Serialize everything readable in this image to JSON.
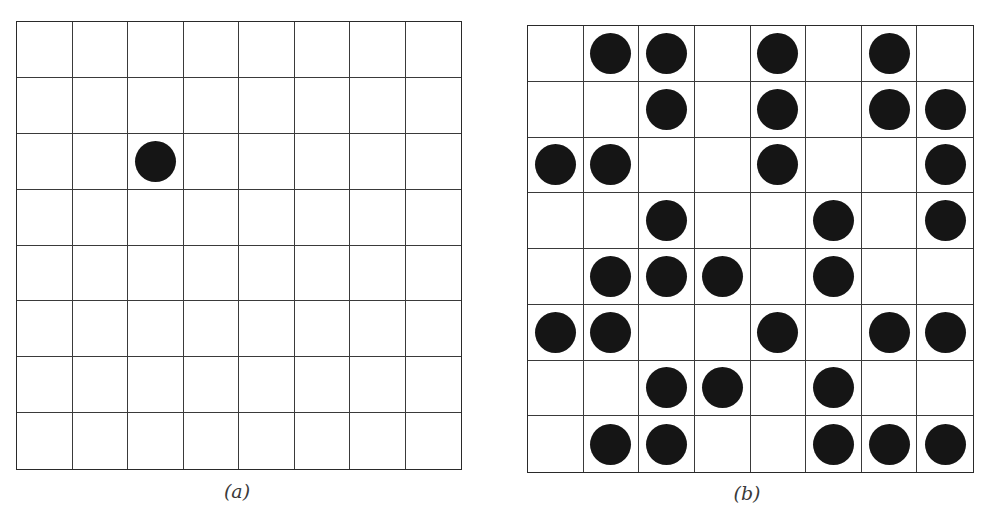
{
  "figure": {
    "rows": 8,
    "cols": 8,
    "panels": [
      {
        "id": "a",
        "caption": "(a)",
        "cells": [
          [
            0,
            0,
            0,
            0,
            0,
            0,
            0,
            0
          ],
          [
            0,
            0,
            0,
            0,
            0,
            0,
            0,
            0
          ],
          [
            0,
            0,
            1,
            0,
            0,
            0,
            0,
            0
          ],
          [
            0,
            0,
            0,
            0,
            0,
            0,
            0,
            0
          ],
          [
            0,
            0,
            0,
            0,
            0,
            0,
            0,
            0
          ],
          [
            0,
            0,
            0,
            0,
            0,
            0,
            0,
            0
          ],
          [
            0,
            0,
            0,
            0,
            0,
            0,
            0,
            0
          ],
          [
            0,
            0,
            0,
            0,
            0,
            0,
            0,
            0
          ]
        ]
      },
      {
        "id": "b",
        "caption": "(b)",
        "cells": [
          [
            0,
            1,
            1,
            0,
            1,
            0,
            1,
            0
          ],
          [
            0,
            0,
            1,
            0,
            1,
            0,
            1,
            1
          ],
          [
            1,
            1,
            0,
            0,
            1,
            0,
            0,
            1
          ],
          [
            0,
            0,
            1,
            0,
            0,
            1,
            0,
            1
          ],
          [
            0,
            1,
            1,
            1,
            0,
            1,
            0,
            0
          ],
          [
            1,
            1,
            0,
            0,
            1,
            0,
            1,
            1
          ],
          [
            0,
            0,
            1,
            1,
            0,
            1,
            0,
            0
          ],
          [
            0,
            1,
            1,
            0,
            0,
            1,
            1,
            1
          ]
        ]
      }
    ],
    "colors": {
      "dot": "#151515",
      "grid_line": "#3a3a3a",
      "background": "#ffffff",
      "caption": "#3a3a3a"
    }
  }
}
